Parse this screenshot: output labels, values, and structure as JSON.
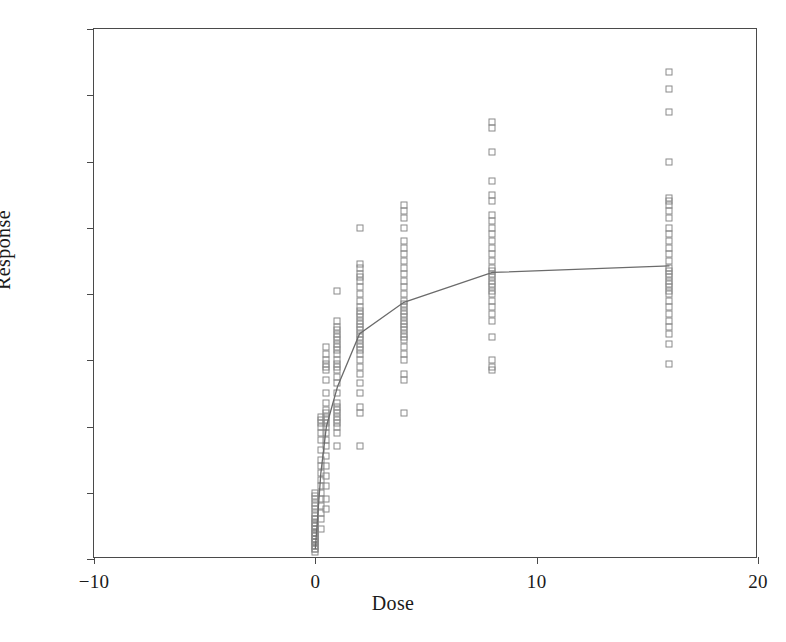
{
  "chart_data": {
    "type": "scatter",
    "title": "",
    "xlabel": "Dose",
    "ylabel": "Response",
    "xlim": [
      -10,
      20
    ],
    "ylim": [
      0.0,
      1.6
    ],
    "xticks": [
      -10,
      0,
      10,
      20
    ],
    "xtick_labels": [
      "−10",
      "0",
      "10",
      "20"
    ],
    "yticks": [
      0.0,
      0.2,
      0.4,
      0.6,
      0.8,
      1.0,
      1.2,
      1.4,
      1.6
    ],
    "ytick_labels": [
      "0.0",
      "0.2",
      "0.4",
      "0.6",
      "0.8",
      "1.0",
      "1.2",
      "1.4",
      "1.6"
    ],
    "grid": false,
    "legend": "none",
    "marker_style": "open-square",
    "marker_color": "#8a8a8a",
    "line_color": "#6b6b6b",
    "frame_color": "#4a4a4a",
    "series": [
      {
        "name": "Observations",
        "points": [
          [
            0,
            0.02
          ],
          [
            0,
            0.03
          ],
          [
            0,
            0.03
          ],
          [
            0,
            0.04
          ],
          [
            0,
            0.04
          ],
          [
            0,
            0.05
          ],
          [
            0,
            0.05
          ],
          [
            0,
            0.06
          ],
          [
            0,
            0.06
          ],
          [
            0,
            0.07
          ],
          [
            0,
            0.07
          ],
          [
            0,
            0.08
          ],
          [
            0,
            0.08
          ],
          [
            0,
            0.09
          ],
          [
            0,
            0.09
          ],
          [
            0,
            0.1
          ],
          [
            0,
            0.1
          ],
          [
            0,
            0.11
          ],
          [
            0,
            0.12
          ],
          [
            0,
            0.12
          ],
          [
            0,
            0.13
          ],
          [
            0,
            0.14
          ],
          [
            0,
            0.15
          ],
          [
            0,
            0.16
          ],
          [
            0,
            0.17
          ],
          [
            0,
            0.18
          ],
          [
            0,
            0.19
          ],
          [
            0,
            0.2
          ],
          [
            0,
            0.05
          ],
          [
            0,
            0.06
          ],
          [
            0,
            0.08
          ],
          [
            0,
            0.11
          ],
          [
            0.25,
            0.09
          ],
          [
            0.25,
            0.12
          ],
          [
            0.25,
            0.14
          ],
          [
            0.25,
            0.16
          ],
          [
            0.25,
            0.18
          ],
          [
            0.25,
            0.2
          ],
          [
            0.25,
            0.22
          ],
          [
            0.25,
            0.24
          ],
          [
            0.25,
            0.26
          ],
          [
            0.25,
            0.28
          ],
          [
            0.25,
            0.3
          ],
          [
            0.25,
            0.33
          ],
          [
            0.25,
            0.36
          ],
          [
            0.25,
            0.38
          ],
          [
            0.25,
            0.4
          ],
          [
            0.25,
            0.41
          ],
          [
            0.25,
            0.42
          ],
          [
            0.25,
            0.43
          ],
          [
            0.5,
            0.15
          ],
          [
            0.5,
            0.18
          ],
          [
            0.5,
            0.22
          ],
          [
            0.5,
            0.25
          ],
          [
            0.5,
            0.28
          ],
          [
            0.5,
            0.31
          ],
          [
            0.5,
            0.34
          ],
          [
            0.5,
            0.36
          ],
          [
            0.5,
            0.38
          ],
          [
            0.5,
            0.4
          ],
          [
            0.5,
            0.41
          ],
          [
            0.5,
            0.42
          ],
          [
            0.5,
            0.43
          ],
          [
            0.5,
            0.44
          ],
          [
            0.5,
            0.45
          ],
          [
            0.5,
            0.47
          ],
          [
            0.5,
            0.5
          ],
          [
            0.5,
            0.54
          ],
          [
            0.5,
            0.57
          ],
          [
            0.5,
            0.58
          ],
          [
            0.5,
            0.59
          ],
          [
            0.5,
            0.6
          ],
          [
            0.5,
            0.62
          ],
          [
            0.5,
            0.64
          ],
          [
            1,
            0.34
          ],
          [
            1,
            0.38
          ],
          [
            1,
            0.4
          ],
          [
            1,
            0.41
          ],
          [
            1,
            0.42
          ],
          [
            1,
            0.43
          ],
          [
            1,
            0.44
          ],
          [
            1,
            0.45
          ],
          [
            1,
            0.46
          ],
          [
            1,
            0.47
          ],
          [
            1,
            0.5
          ],
          [
            1,
            0.53
          ],
          [
            1,
            0.55
          ],
          [
            1,
            0.57
          ],
          [
            1,
            0.58
          ],
          [
            1,
            0.59
          ],
          [
            1,
            0.6
          ],
          [
            1,
            0.62
          ],
          [
            1,
            0.63
          ],
          [
            1,
            0.64
          ],
          [
            1,
            0.65
          ],
          [
            1,
            0.66
          ],
          [
            1,
            0.67
          ],
          [
            1,
            0.68
          ],
          [
            1,
            0.69
          ],
          [
            1,
            0.7
          ],
          [
            1,
            0.72
          ],
          [
            1,
            0.81
          ],
          [
            2,
            0.34
          ],
          [
            2,
            0.44
          ],
          [
            2,
            0.46
          ],
          [
            2,
            0.5
          ],
          [
            2,
            0.53
          ],
          [
            2,
            0.56
          ],
          [
            2,
            0.58
          ],
          [
            2,
            0.6
          ],
          [
            2,
            0.62
          ],
          [
            2,
            0.63
          ],
          [
            2,
            0.64
          ],
          [
            2,
            0.65
          ],
          [
            2,
            0.66
          ],
          [
            2,
            0.67
          ],
          [
            2,
            0.68
          ],
          [
            2,
            0.69
          ],
          [
            2,
            0.7
          ],
          [
            2,
            0.71
          ],
          [
            2,
            0.72
          ],
          [
            2,
            0.73
          ],
          [
            2,
            0.74
          ],
          [
            2,
            0.75
          ],
          [
            2,
            0.76
          ],
          [
            2,
            0.78
          ],
          [
            2,
            0.8
          ],
          [
            2,
            0.82
          ],
          [
            2,
            0.84
          ],
          [
            2,
            0.85
          ],
          [
            2,
            0.86
          ],
          [
            2,
            0.88
          ],
          [
            2,
            0.89
          ],
          [
            2,
            1.0
          ],
          [
            4,
            0.44
          ],
          [
            4,
            0.54
          ],
          [
            4,
            0.56
          ],
          [
            4,
            0.6
          ],
          [
            4,
            0.62
          ],
          [
            4,
            0.64
          ],
          [
            4,
            0.66
          ],
          [
            4,
            0.67
          ],
          [
            4,
            0.68
          ],
          [
            4,
            0.69
          ],
          [
            4,
            0.7
          ],
          [
            4,
            0.71
          ],
          [
            4,
            0.72
          ],
          [
            4,
            0.73
          ],
          [
            4,
            0.74
          ],
          [
            4,
            0.75
          ],
          [
            4,
            0.76
          ],
          [
            4,
            0.77
          ],
          [
            4,
            0.78
          ],
          [
            4,
            0.8
          ],
          [
            4,
            0.82
          ],
          [
            4,
            0.84
          ],
          [
            4,
            0.86
          ],
          [
            4,
            0.88
          ],
          [
            4,
            0.9
          ],
          [
            4,
            0.92
          ],
          [
            4,
            0.94
          ],
          [
            4,
            0.96
          ],
          [
            4,
            1.0
          ],
          [
            4,
            1.03
          ],
          [
            4,
            1.05
          ],
          [
            4,
            1.07
          ],
          [
            8,
            0.57
          ],
          [
            8,
            0.58
          ],
          [
            8,
            0.6
          ],
          [
            8,
            0.67
          ],
          [
            8,
            0.72
          ],
          [
            8,
            0.74
          ],
          [
            8,
            0.76
          ],
          [
            8,
            0.78
          ],
          [
            8,
            0.8
          ],
          [
            8,
            0.81
          ],
          [
            8,
            0.82
          ],
          [
            8,
            0.83
          ],
          [
            8,
            0.84
          ],
          [
            8,
            0.85
          ],
          [
            8,
            0.86
          ],
          [
            8,
            0.87
          ],
          [
            8,
            0.88
          ],
          [
            8,
            0.9
          ],
          [
            8,
            0.92
          ],
          [
            8,
            0.94
          ],
          [
            8,
            0.96
          ],
          [
            8,
            0.98
          ],
          [
            8,
            1.0
          ],
          [
            8,
            1.02
          ],
          [
            8,
            1.04
          ],
          [
            8,
            1.08
          ],
          [
            8,
            1.1
          ],
          [
            8,
            1.14
          ],
          [
            8,
            1.23
          ],
          [
            8,
            1.3
          ],
          [
            8,
            1.32
          ],
          [
            16,
            0.59
          ],
          [
            16,
            0.65
          ],
          [
            16,
            0.68
          ],
          [
            16,
            0.7
          ],
          [
            16,
            0.72
          ],
          [
            16,
            0.74
          ],
          [
            16,
            0.76
          ],
          [
            16,
            0.78
          ],
          [
            16,
            0.8
          ],
          [
            16,
            0.81
          ],
          [
            16,
            0.82
          ],
          [
            16,
            0.83
          ],
          [
            16,
            0.84
          ],
          [
            16,
            0.85
          ],
          [
            16,
            0.86
          ],
          [
            16,
            0.87
          ],
          [
            16,
            0.88
          ],
          [
            16,
            0.9
          ],
          [
            16,
            0.92
          ],
          [
            16,
            0.94
          ],
          [
            16,
            0.96
          ],
          [
            16,
            0.98
          ],
          [
            16,
            1.0
          ],
          [
            16,
            1.03
          ],
          [
            16,
            1.05
          ],
          [
            16,
            1.07
          ],
          [
            16,
            1.08
          ],
          [
            16,
            1.09
          ],
          [
            16,
            1.2
          ],
          [
            16,
            1.35
          ],
          [
            16,
            1.42
          ],
          [
            16,
            1.47
          ]
        ]
      }
    ],
    "fit_line": {
      "name": "Fitted mean response",
      "points": [
        [
          0,
          0.03
        ],
        [
          0.25,
          0.26
        ],
        [
          0.5,
          0.4
        ],
        [
          1,
          0.52
        ],
        [
          2,
          0.68
        ],
        [
          4,
          0.775
        ],
        [
          8,
          0.865
        ],
        [
          16,
          0.885
        ]
      ]
    }
  }
}
